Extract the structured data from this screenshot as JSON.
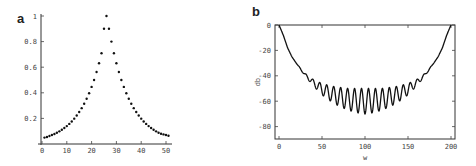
{
  "chart_data": [
    {
      "panel": "a",
      "type": "scatter",
      "title": "",
      "xlabel": "",
      "ylabel": "",
      "xlim": [
        0,
        52
      ],
      "ylim": [
        0,
        1
      ],
      "xticks": [
        0,
        10,
        20,
        30,
        40,
        50
      ],
      "yticks": [
        0.2,
        0.4,
        0.6,
        0.8,
        1
      ],
      "ytick_labels": [
        "0.2",
        "0.4",
        "0.6",
        "0.8",
        "1"
      ],
      "xtick_labels": [
        "0",
        "10",
        "20",
        "30",
        "40",
        "50"
      ],
      "grid": false,
      "peak": {
        "x": 26,
        "y": 1.0
      },
      "x": [
        1,
        2,
        3,
        4,
        5,
        6,
        7,
        8,
        9,
        10,
        11,
        12,
        13,
        14,
        15,
        16,
        17,
        18,
        19,
        20,
        21,
        22,
        23,
        24,
        25,
        26,
        27,
        28,
        29,
        30,
        31,
        32,
        33,
        34,
        35,
        36,
        37,
        38,
        39,
        40,
        41,
        42,
        43,
        44,
        45,
        46,
        47,
        48,
        49,
        50,
        51
      ],
      "values": [
        0.05,
        0.055,
        0.062,
        0.07,
        0.078,
        0.088,
        0.099,
        0.111,
        0.125,
        0.14,
        0.157,
        0.176,
        0.198,
        0.223,
        0.25,
        0.28,
        0.315,
        0.354,
        0.397,
        0.446,
        0.5,
        0.562,
        0.631,
        0.709,
        0.9,
        1.0,
        0.9,
        0.8,
        0.709,
        0.631,
        0.562,
        0.5,
        0.446,
        0.397,
        0.354,
        0.315,
        0.28,
        0.25,
        0.223,
        0.198,
        0.176,
        0.157,
        0.14,
        0.125,
        0.111,
        0.099,
        0.088,
        0.08,
        0.075,
        0.07,
        0.065
      ]
    },
    {
      "panel": "b",
      "type": "line",
      "title": "",
      "xlabel": "w",
      "ylabel": "db",
      "xlim": [
        0,
        200
      ],
      "ylim": [
        -90,
        0
      ],
      "xticks": [
        0,
        50,
        100,
        150,
        200
      ],
      "xtick_labels": [
        "0",
        "50",
        "100",
        "150",
        "200"
      ],
      "yticks": [
        0,
        -20,
        -40,
        -60,
        -80
      ],
      "ytick_labels": [
        "0",
        "-20",
        "-40",
        "-60",
        "-80"
      ],
      "grid": false,
      "description": "Bowl-shaped frequency response starting at 0 dB at w=0, falling to an oscillating envelope with minimum around -70 dB near w=100, rising back to 0 dB at w=200; ~21 ripple cycles between w≈20 and w≈180",
      "x": [
        0,
        5,
        10,
        15,
        20,
        30,
        40,
        50,
        60,
        70,
        80,
        90,
        100,
        110,
        120,
        130,
        140,
        150,
        160,
        170,
        180,
        185,
        190,
        195,
        200
      ],
      "upper_envelope": [
        0,
        -8,
        -18,
        -25,
        -30,
        -38,
        -43,
        -46,
        -48,
        -49,
        -50,
        -50,
        -50,
        -50,
        -50,
        -49,
        -48,
        -46,
        -43,
        -38,
        -30,
        -25,
        -18,
        -8,
        0
      ],
      "lower_envelope": [
        0,
        -8,
        -18,
        -25,
        -30,
        -40,
        -48,
        -55,
        -60,
        -64,
        -67,
        -69,
        -70,
        -69,
        -67,
        -64,
        -60,
        -55,
        -48,
        -40,
        -30,
        -25,
        -18,
        -8,
        0
      ],
      "ripple_cycles": 21
    }
  ],
  "panels": {
    "a": {
      "letter": "a"
    },
    "b": {
      "letter": "b",
      "xlabel": "w",
      "ylabel": "db"
    }
  }
}
